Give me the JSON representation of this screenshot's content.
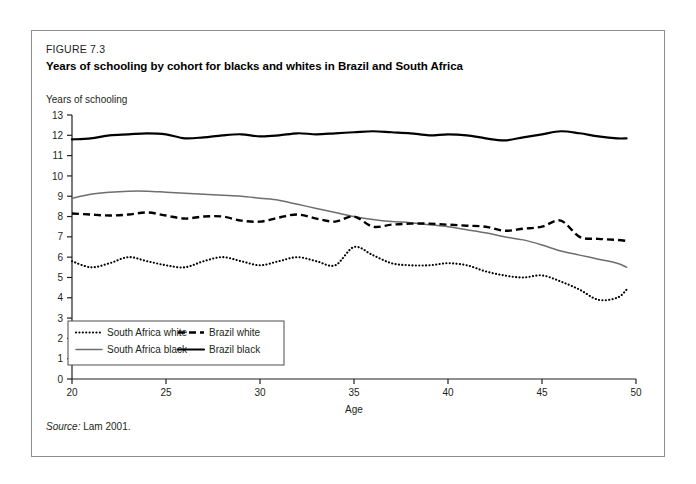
{
  "figure": {
    "number": "FIGURE 7.3",
    "title": "Years of schooling by cohort for blacks and whites in Brazil and South Africa",
    "source_label": "Source:",
    "source_text": "Lam 2001."
  },
  "chart_data": {
    "type": "line",
    "title": "Years of schooling by cohort for blacks and whites in Brazil and South Africa",
    "xlabel": "Age",
    "ylabel": "Years of schooling",
    "xlim": [
      20,
      50
    ],
    "ylim": [
      0,
      13
    ],
    "xticks": [
      20,
      25,
      30,
      35,
      40,
      45,
      50
    ],
    "yticks": [
      0,
      1,
      2,
      3,
      4,
      5,
      6,
      7,
      8,
      9,
      10,
      11,
      12,
      13
    ],
    "grid": false,
    "legend_position": "lower-left-inside",
    "x": [
      20,
      21,
      22,
      23,
      24,
      25,
      26,
      27,
      28,
      29,
      30,
      31,
      32,
      33,
      34,
      35,
      36,
      37,
      38,
      39,
      40,
      41,
      42,
      43,
      44,
      45,
      46,
      47,
      48,
      49,
      49.5
    ],
    "series": [
      {
        "name": "South Africa white",
        "style": "dotted",
        "color": "#000000",
        "values": [
          5.8,
          5.5,
          5.7,
          6.0,
          5.8,
          5.6,
          5.5,
          5.8,
          6.0,
          5.8,
          5.6,
          5.8,
          6.0,
          5.8,
          5.6,
          6.5,
          6.1,
          5.7,
          5.6,
          5.6,
          5.7,
          5.6,
          5.3,
          5.1,
          5.0,
          5.1,
          4.8,
          4.4,
          3.9,
          4.0,
          4.4
        ]
      },
      {
        "name": "South Africa black",
        "style": "solid-gray",
        "color": "#6e6e6e",
        "values": [
          8.9,
          9.1,
          9.2,
          9.25,
          9.25,
          9.2,
          9.15,
          9.1,
          9.05,
          9.0,
          8.9,
          8.8,
          8.6,
          8.4,
          8.2,
          8.0,
          7.85,
          7.75,
          7.7,
          7.6,
          7.5,
          7.35,
          7.2,
          7.0,
          6.85,
          6.6,
          6.3,
          6.1,
          5.9,
          5.7,
          5.5
        ]
      },
      {
        "name": "Brazil white",
        "style": "dashed",
        "color": "#000000",
        "values": [
          8.15,
          8.1,
          8.05,
          8.1,
          8.2,
          8.05,
          7.9,
          8.0,
          8.0,
          7.8,
          7.75,
          7.95,
          8.1,
          7.9,
          7.75,
          8.0,
          7.5,
          7.6,
          7.65,
          7.65,
          7.6,
          7.55,
          7.5,
          7.3,
          7.4,
          7.5,
          7.8,
          7.0,
          6.9,
          6.85,
          6.8
        ]
      },
      {
        "name": "Brazil black",
        "style": "solid-black",
        "color": "#000000",
        "values": [
          11.8,
          11.85,
          12.0,
          12.05,
          12.1,
          12.05,
          11.85,
          11.9,
          12.0,
          12.05,
          11.95,
          12.0,
          12.1,
          12.05,
          12.1,
          12.15,
          12.2,
          12.15,
          12.1,
          12.0,
          12.05,
          12.0,
          11.85,
          11.75,
          11.9,
          12.05,
          12.2,
          12.1,
          11.95,
          11.85,
          11.85
        ]
      }
    ]
  },
  "legend": {
    "entries": [
      {
        "label": "South Africa white",
        "style": "dotted"
      },
      {
        "label": "Brazil white",
        "style": "dashed"
      },
      {
        "label": "South Africa black",
        "style": "solid-gray"
      },
      {
        "label": "Brazil black",
        "style": "solid-black"
      }
    ]
  }
}
